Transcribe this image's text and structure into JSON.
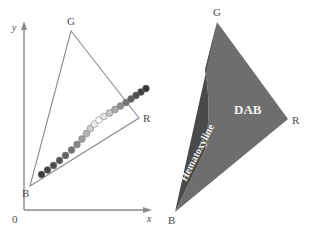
{
  "figure": {
    "panels": [
      {
        "id": "left",
        "name": "rgb-triangle-with-stain-trajectory",
        "axes": {
          "x_label": "x",
          "y_label": "y",
          "origin_label": "0",
          "axis_color": "#8a8a8a"
        },
        "vertices": [
          {
            "label": "G",
            "x": 71,
            "y": 31
          },
          {
            "label": "R",
            "x": 139,
            "y": 118
          },
          {
            "label": "B",
            "x": 30,
            "y": 186
          }
        ],
        "triangle_outline_color": "#8a8a8a",
        "trajectory": {
          "name": "stain-intensity-dot-series",
          "count": 21,
          "dot_radius": 3.4,
          "points": [
            {
              "x": 41.5,
              "y": 174.5,
              "color": "#3c3c3c"
            },
            {
              "x": 47.5,
              "y": 170.0,
              "color": "#434343"
            },
            {
              "x": 53.5,
              "y": 165.5,
              "color": "#4d4d4d"
            },
            {
              "x": 59.5,
              "y": 160.5,
              "color": "#565656"
            },
            {
              "x": 65.5,
              "y": 155.5,
              "color": "#636363"
            },
            {
              "x": 71.5,
              "y": 150.0,
              "color": "#727272"
            },
            {
              "x": 77.0,
              "y": 144.5,
              "color": "#868686"
            },
            {
              "x": 82.0,
              "y": 139.0,
              "color": "#9c9c9c"
            },
            {
              "x": 86.5,
              "y": 133.5,
              "color": "#b5b5b5"
            },
            {
              "x": 90.5,
              "y": 128.5,
              "color": "#cfcfcf"
            },
            {
              "x": 94.5,
              "y": 124.0,
              "color": "#ececec"
            },
            {
              "x": 99.0,
              "y": 120.0,
              "color": "#fbfbfb"
            },
            {
              "x": 104.0,
              "y": 116.5,
              "color": "#e4e4e4"
            },
            {
              "x": 109.5,
              "y": 113.0,
              "color": "#c6c6c6"
            },
            {
              "x": 115.0,
              "y": 109.5,
              "color": "#a9a9a9"
            },
            {
              "x": 120.5,
              "y": 106.0,
              "color": "#8f8f8f"
            },
            {
              "x": 126.0,
              "y": 102.5,
              "color": "#757575"
            },
            {
              "x": 131.0,
              "y": 99.0,
              "color": "#5f5f5f"
            },
            {
              "x": 136.0,
              "y": 95.5,
              "color": "#4d4d4d"
            },
            {
              "x": 141.0,
              "y": 92.0,
              "color": "#3f3f3f"
            },
            {
              "x": 146.0,
              "y": 88.5,
              "color": "#363636"
            }
          ]
        }
      },
      {
        "id": "right",
        "name": "rgb-triangle-stain-region-partition",
        "vertices": [
          {
            "label": "G",
            "x": 217,
            "y": 22
          },
          {
            "label": "R",
            "x": 288,
            "y": 119
          },
          {
            "label": "B",
            "x": 175,
            "y": 212
          }
        ],
        "regions": [
          {
            "name": "hematoxyline-region",
            "label": "Hematoxyline",
            "color": "#4a4a4a",
            "label_color": "#f2f2f2",
            "label_rotation": -63
          },
          {
            "name": "dab-region",
            "label": "DAB",
            "color": "#6e6e6e",
            "label_color": "#f2f2f2",
            "label_rotation": 0
          }
        ]
      }
    ]
  }
}
